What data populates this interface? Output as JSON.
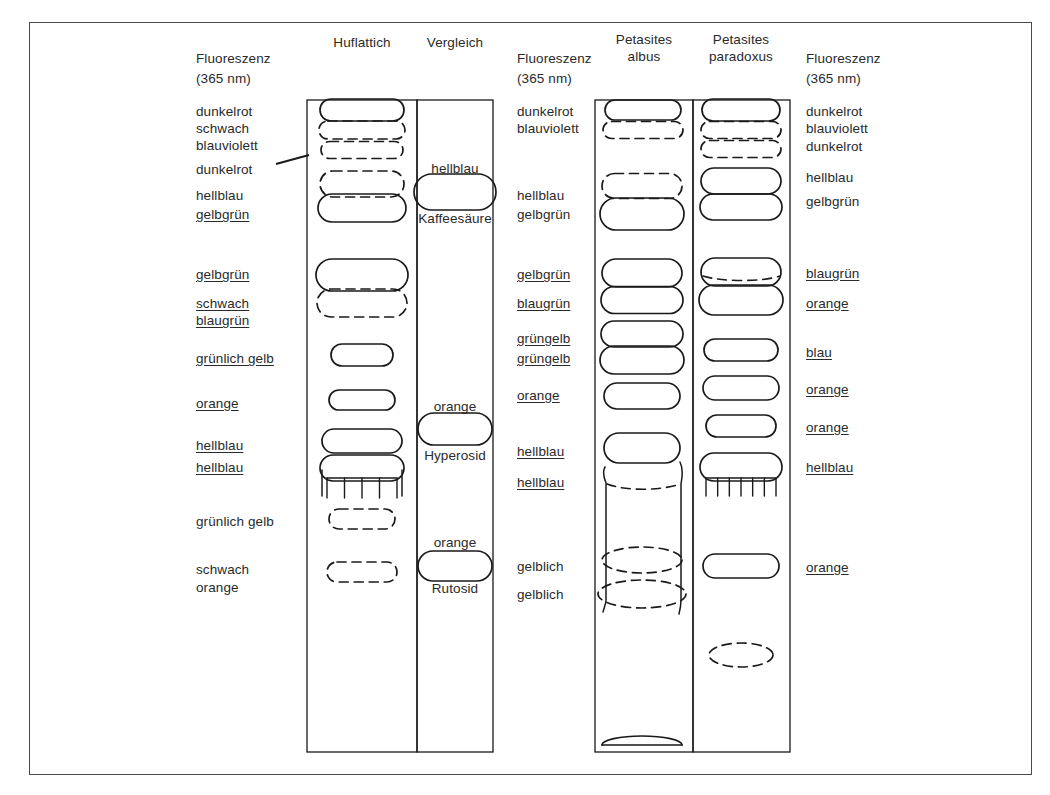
{
  "figure": {
    "frame_color": "#4a4a4a",
    "ink_color": "#1a1a1a"
  },
  "headers": {
    "lane1": "Huflattich",
    "lane2": "Vergleich",
    "lane3_line1": "Petasites",
    "lane3_line2": "albus",
    "lane4_line1": "Petasites",
    "lane4_line2": "paradoxus"
  },
  "axis_labels": {
    "left_line1": "Fluoreszenz",
    "left_line2": "(365 nm)",
    "mid_line1": "Fluoreszenz",
    "mid_line2": "(365 nm)",
    "right_line1": "Fluoreszenz",
    "right_line2": "(365 nm)"
  },
  "left_labels": [
    {
      "id": "l1",
      "text": "dunkelrot",
      "x": 196,
      "y": 103,
      "underline": false
    },
    {
      "id": "l2",
      "text": "schwach",
      "x": 196,
      "y": 120,
      "underline": false
    },
    {
      "id": "l3",
      "text": "blauviolett",
      "x": 196,
      "y": 137,
      "underline": false
    },
    {
      "id": "l4",
      "text": "dunkelrot",
      "x": 196,
      "y": 161,
      "underline": false
    },
    {
      "id": "l5",
      "text": "hellblau",
      "x": 196,
      "y": 187,
      "underline": false
    },
    {
      "id": "l6",
      "text": "gelbgrün",
      "x": 196,
      "y": 206,
      "underline": true
    },
    {
      "id": "l7",
      "text": "gelbgrün",
      "x": 196,
      "y": 266,
      "underline": true
    },
    {
      "id": "l8",
      "text": "schwach",
      "x": 196,
      "y": 295,
      "underline": true
    },
    {
      "id": "l9",
      "text": "blaugrün",
      "x": 196,
      "y": 312,
      "underline": true
    },
    {
      "id": "l10",
      "text": "grünlich gelb",
      "x": 196,
      "y": 350,
      "underline": true
    },
    {
      "id": "l11",
      "text": "orange",
      "x": 196,
      "y": 395,
      "underline": true
    },
    {
      "id": "l12",
      "text": "hellblau",
      "x": 196,
      "y": 437,
      "underline": true
    },
    {
      "id": "l13",
      "text": "hellblau",
      "x": 196,
      "y": 459,
      "underline": true
    },
    {
      "id": "l14",
      "text": "grünlich gelb",
      "x": 196,
      "y": 513,
      "underline": false
    },
    {
      "id": "l15",
      "text": "schwach",
      "x": 196,
      "y": 561,
      "underline": false
    },
    {
      "id": "l16",
      "text": "orange",
      "x": 196,
      "y": 579,
      "underline": false
    }
  ],
  "mid_labels": [
    {
      "id": "m1",
      "text": "dunkelrot",
      "x": 517,
      "y": 103,
      "underline": false
    },
    {
      "id": "m2",
      "text": "blauviolett",
      "x": 517,
      "y": 120,
      "underline": false
    },
    {
      "id": "m3",
      "text": "hellblau",
      "x": 517,
      "y": 187,
      "underline": false
    },
    {
      "id": "m4",
      "text": "gelbgrün",
      "x": 517,
      "y": 206,
      "underline": false
    },
    {
      "id": "m5",
      "text": "gelbgrün",
      "x": 517,
      "y": 266,
      "underline": true
    },
    {
      "id": "m6",
      "text": "blaugrün",
      "x": 517,
      "y": 295,
      "underline": true
    },
    {
      "id": "m7",
      "text": "grüngelb",
      "x": 517,
      "y": 330,
      "underline": true
    },
    {
      "id": "m8",
      "text": "grüngelb",
      "x": 517,
      "y": 350,
      "underline": true
    },
    {
      "id": "m9",
      "text": "orange",
      "x": 517,
      "y": 387,
      "underline": true
    },
    {
      "id": "m10",
      "text": "hellblau",
      "x": 517,
      "y": 443,
      "underline": true
    },
    {
      "id": "m11",
      "text": "hellblau",
      "x": 517,
      "y": 474,
      "underline": true
    },
    {
      "id": "m12",
      "text": "gelblich",
      "x": 517,
      "y": 558,
      "underline": false
    },
    {
      "id": "m13",
      "text": "gelblich",
      "x": 517,
      "y": 586,
      "underline": false
    }
  ],
  "right_labels": [
    {
      "id": "r1",
      "text": "dunkelrot",
      "x": 806,
      "y": 103,
      "underline": false
    },
    {
      "id": "r2",
      "text": "blauviolett",
      "x": 806,
      "y": 120,
      "underline": false
    },
    {
      "id": "r3",
      "text": "dunkelrot",
      "x": 806,
      "y": 138,
      "underline": false
    },
    {
      "id": "r4",
      "text": "hellblau",
      "x": 806,
      "y": 169,
      "underline": false
    },
    {
      "id": "r5",
      "text": "gelbgrün",
      "x": 806,
      "y": 193,
      "underline": false
    },
    {
      "id": "r6",
      "text": "blaugrün",
      "x": 806,
      "y": 265,
      "underline": true
    },
    {
      "id": "r7",
      "text": "orange",
      "x": 806,
      "y": 295,
      "underline": true
    },
    {
      "id": "r8",
      "text": "blau",
      "x": 806,
      "y": 344,
      "underline": true
    },
    {
      "id": "r9",
      "text": "orange",
      "x": 806,
      "y": 381,
      "underline": true
    },
    {
      "id": "r10",
      "text": "orange",
      "x": 806,
      "y": 419,
      "underline": true
    },
    {
      "id": "r11",
      "text": "hellblau",
      "x": 806,
      "y": 459,
      "underline": true
    },
    {
      "id": "r12",
      "text": "orange",
      "x": 806,
      "y": 559,
      "underline": true
    }
  ],
  "reference_spots": [
    {
      "id": "ref1",
      "name_above": "hellblau",
      "name_below": "Kaffeesäure",
      "label_above_y": 160,
      "label_below_y": 210,
      "cx": 455,
      "cy": 192,
      "rx": 41,
      "ry": 18
    },
    {
      "id": "ref2",
      "name_above": "orange",
      "name_below": "Hyperosid",
      "label_above_y": 398,
      "label_below_y": 447,
      "cx": 455,
      "cy": 429,
      "rx": 37,
      "ry": 16
    },
    {
      "id": "ref3",
      "name_above": "orange",
      "name_below": "Rutosid",
      "label_above_y": 534,
      "label_below_y": 580,
      "cx": 455,
      "cy": 566,
      "rx": 37,
      "ry": 15
    }
  ],
  "lanes": [
    {
      "id": "lane-huflattich",
      "x": 307,
      "y": 100,
      "w": 110,
      "h": 652
    },
    {
      "id": "lane-vergleich",
      "x": 417,
      "y": 100,
      "w": 76,
      "h": 652
    },
    {
      "id": "lane-petasites-albus",
      "x": 595,
      "y": 100,
      "w": 98,
      "h": 652
    },
    {
      "id": "lane-petasites-paradoxus",
      "x": 693,
      "y": 100,
      "w": 97,
      "h": 652
    }
  ],
  "chart_data": {
    "type": "diagram",
    "lane_names": [
      "Huflattich",
      "Vergleich",
      "Petasites albus",
      "Petasites paradoxus"
    ],
    "reference_compounds": [
      "Kaffeesäure",
      "Hyperosid",
      "Rutosid"
    ],
    "bands": {
      "Huflattich": [
        {
          "label": "dunkelrot",
          "cy": 109,
          "style": "solid"
        },
        {
          "label": "schwach blauviolett",
          "cy": 128,
          "style": "dashed"
        },
        {
          "label": "dunkelrot",
          "cy": 148,
          "style": "dashed"
        },
        {
          "label": "hellblau",
          "cy": 182,
          "style": "dashed"
        },
        {
          "label": "gelbgrün",
          "cy": 206,
          "style": "solid"
        },
        {
          "label": "gelbgrün",
          "cy": 274,
          "style": "solid"
        },
        {
          "label": "schwach blaugrün",
          "cy": 303,
          "style": "dashed"
        },
        {
          "label": "grünlich gelb",
          "cy": 355,
          "style": "solid"
        },
        {
          "label": "orange",
          "cy": 400,
          "style": "solid"
        },
        {
          "label": "hellblau",
          "cy": 442,
          "style": "solid"
        },
        {
          "label": "hellblau",
          "cy": 468,
          "style": "solid"
        },
        {
          "label": "grünlich gelb",
          "cy": 519,
          "style": "dashed"
        },
        {
          "label": "schwach orange",
          "cy": 572,
          "style": "dashed"
        }
      ],
      "Petasites albus": [
        {
          "label": "dunkelrot",
          "cy": 109,
          "style": "solid"
        },
        {
          "label": "blauviolett",
          "cy": 129,
          "style": "dashed"
        },
        {
          "label": "hellblau",
          "cy": 186,
          "style": "dashed"
        },
        {
          "label": "gelbgrün",
          "cy": 213,
          "style": "solid"
        },
        {
          "label": "gelbgrün",
          "cy": 273,
          "style": "solid"
        },
        {
          "label": "blaugrün",
          "cy": 300,
          "style": "solid"
        },
        {
          "label": "grüngelb",
          "cy": 334,
          "style": "solid"
        },
        {
          "label": "grüngelb",
          "cy": 359,
          "style": "solid"
        },
        {
          "label": "orange",
          "cy": 395,
          "style": "solid"
        },
        {
          "label": "hellblau",
          "cy": 448,
          "style": "solid"
        },
        {
          "label": "hellblau",
          "cy": 489,
          "style": "dashed"
        },
        {
          "label": "gelblich",
          "cy": 560,
          "style": "dashed"
        },
        {
          "label": "gelblich",
          "cy": 594,
          "style": "dashed"
        },
        {
          "label": "front",
          "cy": 747,
          "style": "solid"
        }
      ],
      "Petasites paradoxus": [
        {
          "label": "dunkelrot",
          "cy": 109,
          "style": "solid"
        },
        {
          "label": "blauviolett",
          "cy": 129,
          "style": "dashed"
        },
        {
          "label": "dunkelrot",
          "cy": 148,
          "style": "dashed"
        },
        {
          "label": "hellblau",
          "cy": 181,
          "style": "solid"
        },
        {
          "label": "gelbgrün",
          "cy": 207,
          "style": "solid"
        },
        {
          "label": "blaugrün",
          "cy": 272,
          "style": "solid"
        },
        {
          "label": "orange",
          "cy": 298,
          "style": "solid"
        },
        {
          "label": "blau",
          "cy": 350,
          "style": "solid"
        },
        {
          "label": "orange",
          "cy": 388,
          "style": "solid"
        },
        {
          "label": "orange",
          "cy": 426,
          "style": "solid"
        },
        {
          "label": "hellblau",
          "cy": 468,
          "style": "solid"
        },
        {
          "label": "orange",
          "cy": 566,
          "style": "solid"
        },
        {
          "label": "schwach",
          "cy": 655,
          "style": "dashed"
        }
      ]
    }
  }
}
